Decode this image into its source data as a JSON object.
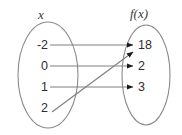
{
  "diagram": {
    "domain_label": "x",
    "range_label": "f(x)",
    "domain_values": [
      "-2",
      "0",
      "1",
      "2"
    ],
    "range_values": [
      "18",
      "2",
      "3"
    ],
    "mappings": [
      {
        "from": "-2",
        "to": "18",
        "style": "horizontal"
      },
      {
        "from": "0",
        "to": "2",
        "style": "horizontal"
      },
      {
        "from": "1",
        "to": "3",
        "style": "horizontal"
      },
      {
        "from": "2",
        "to": "18",
        "style": "diagonal"
      }
    ],
    "colors": {
      "line": "#808080",
      "arrowhead": "#1a1a1a",
      "oval_stroke": "#8a8a8a",
      "text": "#2e2e2e",
      "label_text": "#3a3a3a",
      "background": "#ffffff"
    }
  }
}
